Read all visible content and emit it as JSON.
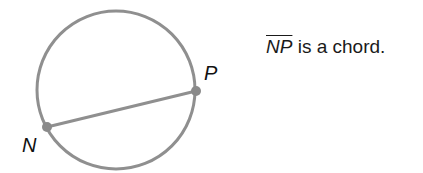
{
  "diagram": {
    "circle": {
      "cx": 116,
      "cy": 90,
      "r": 79,
      "stroke": "#8f8f8f",
      "stroke_width": 3
    },
    "chord": {
      "from": "N",
      "to": "P",
      "stroke": "#8f8f8f",
      "stroke_width": 3
    },
    "points": [
      {
        "name": "N",
        "x": 47,
        "y": 127,
        "label_x": 22,
        "label_y": 134
      },
      {
        "name": "P",
        "x": 196,
        "y": 91,
        "label_x": 204,
        "label_y": 62
      }
    ],
    "point_color": "#8a8a8a"
  },
  "caption": {
    "segment": "NP",
    "text": " is a chord."
  }
}
